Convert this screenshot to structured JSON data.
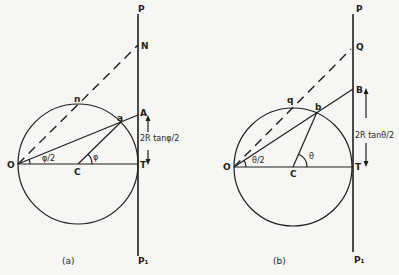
{
  "figure": {
    "panel_a": {
      "caption": "(a)",
      "points": {
        "P": "P",
        "N": "N",
        "A": "A",
        "a": "a",
        "n": "n",
        "O": "O",
        "C": "C",
        "T": "T",
        "P1": "P₁"
      },
      "angle_at_O": "φ/2",
      "angle_at_C": "φ",
      "dimension_label": "2R tanφ/2"
    },
    "panel_b": {
      "caption": "(b)",
      "points": {
        "P": "P",
        "Q": "Q",
        "B": "B",
        "b": "b",
        "q": "q",
        "O": "O",
        "C": "C",
        "T": "T",
        "P1": "P₁"
      },
      "angle_at_O": "θ/2",
      "angle_at_C": "θ",
      "dimension_label": "2R tanθ/2"
    },
    "colors": {
      "ink": "#1e1e1e",
      "paper": "#f6f6f5"
    }
  }
}
